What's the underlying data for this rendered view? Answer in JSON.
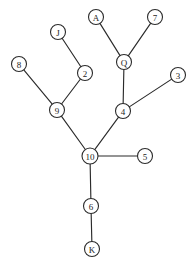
{
  "diagram": {
    "type": "tree-graph",
    "canvas": {
      "width": 194,
      "height": 270
    },
    "style": {
      "background_color": "#ffffff",
      "edge_color": "#2b2b2b",
      "node_fill_color": "#ffffff",
      "node_stroke_color": "#2b2b2b",
      "label_color": "#1d1d1d",
      "node_radius": 7.5
    },
    "nodes": [
      {
        "id": "A",
        "label": "A",
        "x": 96,
        "y": 17,
        "r": 7.5
      },
      {
        "id": "7",
        "label": "7",
        "x": 155,
        "y": 17,
        "r": 7.5
      },
      {
        "id": "J",
        "label": "J",
        "x": 58,
        "y": 32,
        "r": 7.5
      },
      {
        "id": "Q",
        "label": "Q",
        "x": 124,
        "y": 62,
        "r": 7.5
      },
      {
        "id": "8",
        "label": "8",
        "x": 19,
        "y": 64,
        "r": 7.5
      },
      {
        "id": "2",
        "label": "2",
        "x": 85,
        "y": 73,
        "r": 7.5
      },
      {
        "id": "3",
        "label": "3",
        "x": 178,
        "y": 75,
        "r": 7.5
      },
      {
        "id": "9",
        "label": "9",
        "x": 57,
        "y": 110,
        "r": 7.5
      },
      {
        "id": "4",
        "label": "4",
        "x": 123,
        "y": 111,
        "r": 7.5
      },
      {
        "id": "10",
        "label": "10",
        "x": 90,
        "y": 156,
        "r": 8.0
      },
      {
        "id": "5",
        "label": "5",
        "x": 145,
        "y": 156,
        "r": 7.5
      },
      {
        "id": "6",
        "label": "6",
        "x": 91,
        "y": 206,
        "r": 7.5
      },
      {
        "id": "K",
        "label": "K",
        "x": 92,
        "y": 249,
        "r": 7.5
      }
    ],
    "edges": [
      {
        "source": "A",
        "target": "Q"
      },
      {
        "source": "7",
        "target": "Q"
      },
      {
        "source": "Q",
        "target": "4"
      },
      {
        "source": "3",
        "target": "4"
      },
      {
        "source": "4",
        "target": "10"
      },
      {
        "source": "J",
        "target": "2"
      },
      {
        "source": "2",
        "target": "9"
      },
      {
        "source": "8",
        "target": "9"
      },
      {
        "source": "9",
        "target": "10"
      },
      {
        "source": "10",
        "target": "5"
      },
      {
        "source": "10",
        "target": "6"
      },
      {
        "source": "6",
        "target": "K"
      }
    ]
  }
}
